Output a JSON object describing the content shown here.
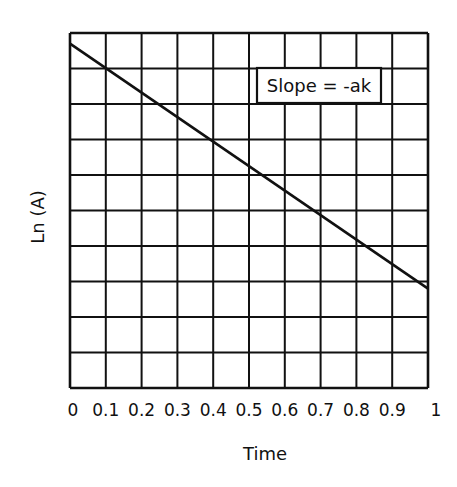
{
  "chart_data": {
    "type": "line",
    "title": "",
    "xlabel": "Time",
    "ylabel": "Ln (A)",
    "x_ticks": [
      "0",
      "0.1",
      "0.2",
      "0.3",
      "0.4",
      "0.5",
      "0.6",
      "0.7",
      "0.8",
      "0.9",
      "1"
    ],
    "y_ticks": [],
    "xlim": [
      0,
      1
    ],
    "ylim": [
      0,
      10
    ],
    "grid": true,
    "grid_columns": 10,
    "grid_rows": 10,
    "legend": null,
    "series": [
      {
        "name": "ln(A) vs time",
        "x": [
          0,
          1
        ],
        "y": [
          9.7,
          2.8
        ],
        "color": "#111111"
      }
    ],
    "annotations": [
      {
        "text": "Slope = -ak",
        "boxed": true,
        "position": "upper-right"
      }
    ]
  },
  "labels": {
    "xlabel": "Time",
    "ylabel": "Ln (A)",
    "annotation": "Slope = -ak"
  },
  "colors": {
    "line": "#111111",
    "grid": "#111111",
    "background": "#ffffff"
  }
}
